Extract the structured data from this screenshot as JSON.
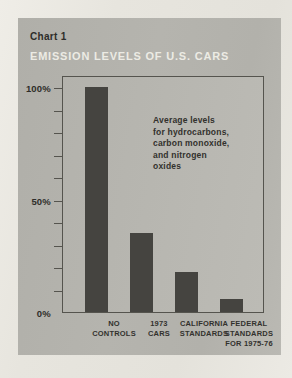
{
  "page": {
    "background": "#e8e6df"
  },
  "card": {
    "background": "#b3b2ac"
  },
  "chart_data": {
    "type": "bar",
    "chart_label": "Chart 1",
    "title": "EMISSION LEVELS OF U.S. CARS",
    "categories": [
      "NO CONTROLS",
      "1973 CARS",
      "CALIFORNIA STANDARDS",
      "FEDERAL STANDARDS FOR 1975-76"
    ],
    "category_lines": [
      [
        "NO",
        "CONTROLS"
      ],
      [
        "1973",
        "CARS"
      ],
      [
        "CALIFORNIA",
        "STANDARDS"
      ],
      [
        "FEDERAL",
        "STANDARDS",
        "FOR 1975-76"
      ]
    ],
    "values": [
      100,
      35,
      18,
      6
    ],
    "unit": "%",
    "ylim": [
      0,
      100
    ],
    "ytick_interval": 10,
    "ytick_labels": [
      {
        "value": 100,
        "label": "100%"
      },
      {
        "value": 50,
        "label": "50%"
      },
      {
        "value": 0,
        "label": "0%"
      }
    ],
    "annotation": "Average levels\nfor hydrocarbons,\ncarbon monoxide,\nand nitrogen\noxides",
    "bar_color": "#454440",
    "xlabel": "",
    "ylabel": "",
    "grid": false,
    "legend": "none"
  }
}
